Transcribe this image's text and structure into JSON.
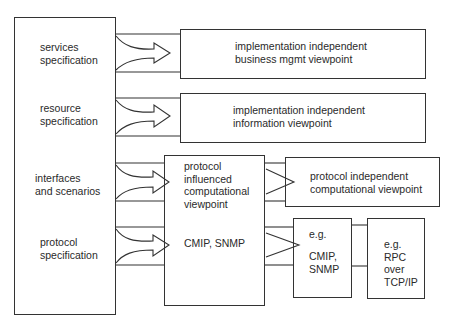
{
  "diagram": {
    "left_box": {
      "labels": [
        "services\nspecification",
        "resource\nspecification",
        "interfaces\nand scenarios",
        "protocol\nspecification"
      ]
    },
    "boxes": {
      "business_mgmt": "implementation independent\nbusiness mgmt viewpoint",
      "information": "implementation independent\ninformation viewpoint",
      "protocol_influenced": "protocol\ninfluenced\ncomputational\nviewpoint",
      "protocol_influenced_example": "CMIP, SNMP",
      "protocol_independent": "protocol independent\ncomputational viewpoint",
      "cmip_snmp_eg": "e.g.",
      "cmip_snmp": "CMIP,\nSNMP",
      "rpc": "e.g.\nRPC\nover\nTCP/IP"
    },
    "edges": [
      {
        "from": "services specification",
        "to": "implementation independent business mgmt viewpoint",
        "style": "curved double-arrow"
      },
      {
        "from": "resource specification",
        "to": "implementation independent information viewpoint",
        "style": "curved double-arrow"
      },
      {
        "from": "interfaces and scenarios",
        "to": "protocol influenced computational viewpoint",
        "style": "curved double-arrow"
      },
      {
        "from": "protocol specification",
        "to": "protocol influenced computational viewpoint (CMIP, SNMP)",
        "style": "curved double-arrow"
      },
      {
        "from": "protocol influenced computational viewpoint",
        "to": "protocol independent computational viewpoint",
        "style": "triangle arrow"
      },
      {
        "from": "CMIP, SNMP",
        "to": "e.g. CMIP, SNMP",
        "style": "triangle arrow"
      },
      {
        "from": "e.g. CMIP, SNMP",
        "to": "e.g. RPC over TCP/IP",
        "style": "channel"
      }
    ]
  }
}
